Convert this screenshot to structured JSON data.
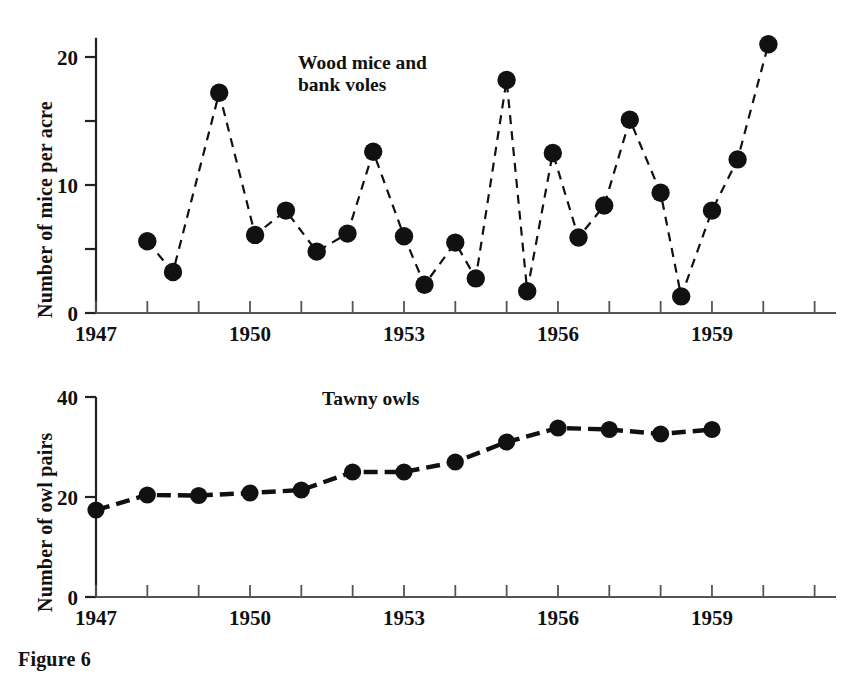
{
  "figure": {
    "caption": "Figure 6"
  },
  "chart_data": [
    {
      "type": "line",
      "id": "wood-mice-and-bank-voles",
      "title": "Wood mice and\nbank voles",
      "xlabel": "",
      "ylabel": "Number of mice per acre",
      "xlim": [
        1947,
        1961
      ],
      "ylim": [
        0,
        21.5
      ],
      "yticks": [
        0,
        5,
        10,
        15,
        20
      ],
      "ytick_labels": [
        "0",
        "",
        "10",
        "",
        "20"
      ],
      "xticks": [
        1947,
        1948,
        1949,
        1950,
        1951,
        1952,
        1953,
        1954,
        1955,
        1956,
        1957,
        1958,
        1959,
        1960,
        1961
      ],
      "xtick_labels": [
        "1947",
        "",
        "",
        "1950",
        "",
        "",
        "1953",
        "",
        "",
        "1956",
        "",
        "",
        "1959",
        "",
        ""
      ],
      "grid": false,
      "legend": "none",
      "linestyle": "dashed",
      "marker": "filled-circle",
      "color": "#111111",
      "x": [
        1948,
        1949,
        1950,
        1951,
        1952,
        1953,
        1954,
        1955,
        1956,
        1957,
        1958,
        1959,
        1960,
        1961
      ],
      "values": [
        5.6,
        3.2,
        17.2,
        6.1,
        8.0,
        4.8,
        6.2,
        12.6,
        6.0,
        2.1,
        2.7,
        18.2,
        1.7,
        12.5
      ],
      "series": [
        {
          "name": "Wood mice and bank voles",
          "points": [
            {
              "x": 1948.0,
              "y": 5.6
            },
            {
              "x": 1948.5,
              "y": 3.2
            },
            {
              "x": 1949.4,
              "y": 17.2
            },
            {
              "x": 1950.1,
              "y": 6.1
            },
            {
              "x": 1950.7,
              "y": 8.0
            },
            {
              "x": 1951.3,
              "y": 4.8
            },
            {
              "x": 1951.9,
              "y": 6.2
            },
            {
              "x": 1952.4,
              "y": 12.6
            },
            {
              "x": 1953.0,
              "y": 6.0
            },
            {
              "x": 1953.4,
              "y": 2.2
            },
            {
              "x": 1954.0,
              "y": 5.5
            },
            {
              "x": 1954.4,
              "y": 2.7
            },
            {
              "x": 1955.0,
              "y": 18.2
            },
            {
              "x": 1955.4,
              "y": 1.7
            },
            {
              "x": 1955.9,
              "y": 12.5
            },
            {
              "x": 1956.4,
              "y": 5.9
            },
            {
              "x": 1956.9,
              "y": 8.4
            },
            {
              "x": 1957.4,
              "y": 15.1
            },
            {
              "x": 1958.0,
              "y": 9.4
            },
            {
              "x": 1958.4,
              "y": 1.3
            },
            {
              "x": 1959.0,
              "y": 8.0
            },
            {
              "x": 1959.5,
              "y": 12.0
            },
            {
              "x": 1960.1,
              "y": 21.0
            }
          ]
        }
      ]
    },
    {
      "type": "line",
      "id": "tawny-owls",
      "title": "Tawny owls",
      "xlabel": "",
      "ylabel": "Number of owl pairs",
      "xlim": [
        1947,
        1961
      ],
      "ylim": [
        0,
        40
      ],
      "yticks": [
        0,
        20,
        40
      ],
      "ytick_labels": [
        "0",
        "20",
        "40"
      ],
      "xticks": [
        1947,
        1948,
        1949,
        1950,
        1951,
        1952,
        1953,
        1954,
        1955,
        1956,
        1957,
        1958,
        1959,
        1960,
        1961
      ],
      "xtick_labels": [
        "1947",
        "",
        "",
        "1950",
        "",
        "",
        "1953",
        "",
        "",
        "1956",
        "",
        "",
        "1959",
        "",
        ""
      ],
      "grid": false,
      "legend": "none",
      "linestyle": "dashed",
      "marker": "filled-circle",
      "color": "#111111",
      "x": [
        1947,
        1948,
        1949,
        1950,
        1951,
        1952,
        1953,
        1954,
        1955,
        1956,
        1957,
        1958,
        1959
      ],
      "values": [
        17.4,
        20.4,
        20.3,
        20.8,
        21.4,
        25.0,
        25.0,
        27.0,
        31.0,
        33.8,
        33.5,
        32.6,
        33.5
      ],
      "series": [
        {
          "name": "Tawny owls",
          "points": [
            {
              "x": 1947.0,
              "y": 17.4
            },
            {
              "x": 1948.0,
              "y": 20.4
            },
            {
              "x": 1949.0,
              "y": 20.3
            },
            {
              "x": 1950.0,
              "y": 20.8
            },
            {
              "x": 1951.0,
              "y": 21.4
            },
            {
              "x": 1952.0,
              "y": 25.0
            },
            {
              "x": 1953.0,
              "y": 25.0
            },
            {
              "x": 1954.0,
              "y": 27.0
            },
            {
              "x": 1955.0,
              "y": 31.0
            },
            {
              "x": 1956.0,
              "y": 33.8
            },
            {
              "x": 1957.0,
              "y": 33.5
            },
            {
              "x": 1958.0,
              "y": 32.6
            },
            {
              "x": 1959.0,
              "y": 33.5
            }
          ]
        }
      ]
    }
  ]
}
